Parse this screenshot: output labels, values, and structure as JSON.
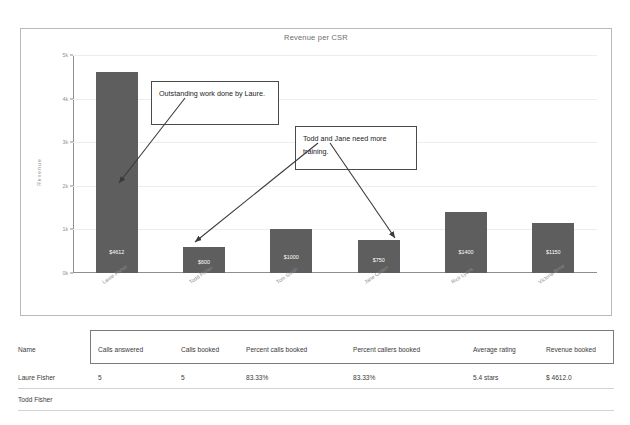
{
  "chart_data": {
    "type": "bar",
    "title": "Revenue per CSR",
    "xlabel": "",
    "ylabel": "Revenue",
    "ylim": [
      0,
      5000
    ],
    "grid": true,
    "legend": "none",
    "ytick_labels": [
      "0k",
      "1k",
      "2k",
      "3k",
      "4k",
      "5k"
    ],
    "ytick_values": [
      0,
      1000,
      2000,
      3000,
      4000,
      5000
    ],
    "categories": [
      "Laure Fisher",
      "Todd Fisher",
      "Tom Smith",
      "Jane Colton",
      "Rick Lyons",
      "Victoria Brise"
    ],
    "values": [
      4612,
      600,
      1000,
      750,
      1400,
      1150
    ],
    "value_labels": [
      "$4612",
      "$600",
      "$1000",
      "$750",
      "$1400",
      "$1150"
    ],
    "bar_color": "#5e5e5e",
    "annotations": [
      {
        "id": "callout-1",
        "text": "Outstanding work done by Laure.",
        "points_to": "Laure Fisher"
      },
      {
        "id": "callout-2",
        "text": "Todd and Jane need more training.",
        "points_to": "Todd Fisher, Jane Colton"
      }
    ]
  },
  "table": {
    "name_header": "Name",
    "columns": [
      "Calls answered",
      "Calls booked",
      "Percent calls booked",
      "Percent callers booked",
      "Average rating",
      "Revenue booked"
    ],
    "rows": [
      {
        "name": "Laure Fisher",
        "cells": [
          "5",
          "5",
          "83.33%",
          "83.33%",
          "5.4 stars",
          "$ 4612.0"
        ]
      },
      {
        "name": "Todd Fisher",
        "cells": [
          "",
          "",
          "",
          "",
          "",
          ""
        ]
      }
    ]
  }
}
